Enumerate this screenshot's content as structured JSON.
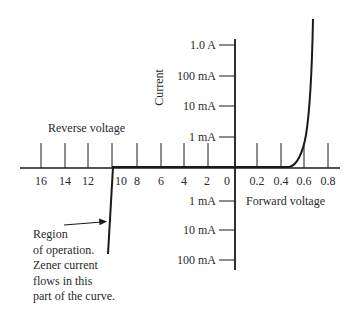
{
  "diagram": {
    "axis_labels": {
      "current": "Current",
      "reverse_voltage": "Reverse voltage",
      "forward_voltage": "Forward voltage"
    },
    "current_ticks_positive": [
      "1.0 A",
      "100 mA",
      "10 mA",
      "1 mA"
    ],
    "current_ticks_negative": [
      "1 mA",
      "10 mA",
      "100 mA"
    ],
    "reverse_voltage_ticks": [
      "16",
      "14",
      "12",
      "10",
      "8",
      "6",
      "4",
      "2",
      "0"
    ],
    "forward_voltage_ticks": [
      "0.2",
      "0.4",
      "0.6",
      "0.8"
    ],
    "annotation": {
      "line1": "Region",
      "line2": "of operation.",
      "line3": "Zener current",
      "line4": "flows in this",
      "line5": "part of the curve."
    },
    "colors": {
      "line": "#1a1a1a",
      "text": "#2a2a2a",
      "background": "#ffffff"
    }
  }
}
